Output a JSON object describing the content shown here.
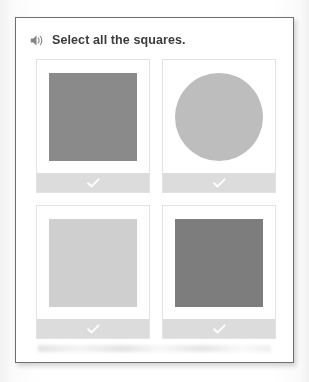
{
  "panel": {
    "prompt": {
      "icon": "speaker-icon",
      "text": "Select all the squares."
    },
    "tiles": [
      {
        "position": "top-left",
        "shape": "square",
        "color": "#8a8a8a",
        "selected": true,
        "check_icon": "check-icon"
      },
      {
        "position": "top-right",
        "shape": "circle",
        "color": "#bdbdbd",
        "selected": true,
        "check_icon": "check-icon"
      },
      {
        "position": "bottom-left",
        "shape": "square",
        "color": "#cfcfcf",
        "selected": true,
        "check_icon": "check-icon"
      },
      {
        "position": "bottom-right",
        "shape": "square",
        "color": "#7d7d7d",
        "selected": true,
        "check_icon": "check-icon"
      }
    ],
    "footer_bar_color": "#dcdcdc",
    "border_color": "#6f6f6f"
  }
}
